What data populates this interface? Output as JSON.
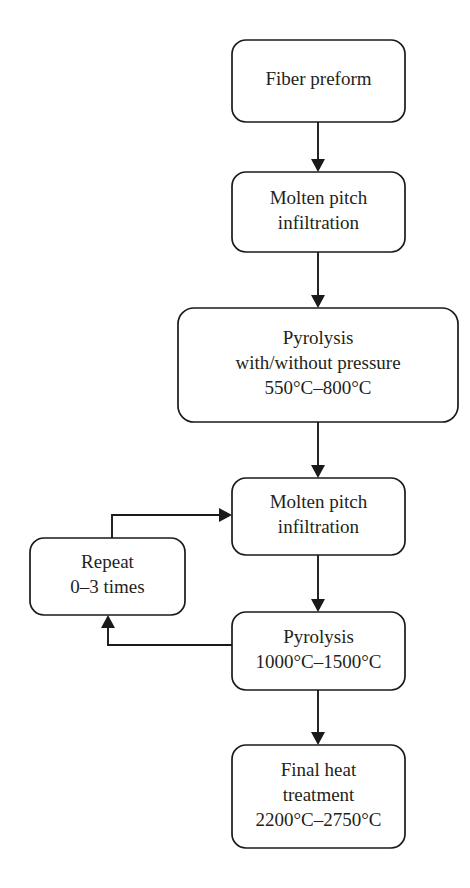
{
  "diagram": {
    "style": {
      "line_color": "#1a1a1a",
      "box_fill": "#ffffff",
      "text_color": "#231f20",
      "background": "#ffffff"
    },
    "nodes": [
      {
        "id": "fiber-preform",
        "name": "fiber-preform",
        "lines": [
          "Fiber preform"
        ],
        "x": 232,
        "y": 40,
        "w": 173,
        "h": 82,
        "r": 14
      },
      {
        "id": "molten-pitch-1",
        "name": "molten-pitch-infiltration-1",
        "lines": [
          "Molten pitch",
          "infiltration"
        ],
        "x": 232,
        "y": 172,
        "w": 173,
        "h": 80,
        "r": 14
      },
      {
        "id": "pyrolysis-1",
        "name": "pyrolysis-low-temperature",
        "lines": [
          "Pyrolysis",
          "with/without pressure",
          "550°C–800°C"
        ],
        "x": 178,
        "y": 308,
        "w": 280,
        "h": 114,
        "r": 16
      },
      {
        "id": "molten-pitch-2",
        "name": "molten-pitch-infiltration-2",
        "lines": [
          "Molten pitch",
          "infiltration"
        ],
        "x": 232,
        "y": 478,
        "w": 173,
        "h": 77,
        "r": 14
      },
      {
        "id": "repeat",
        "name": "repeat-loop",
        "lines": [
          "Repeat",
          "0–3 times"
        ],
        "x": 30,
        "y": 538,
        "w": 155,
        "h": 77,
        "r": 14
      },
      {
        "id": "pyrolysis-2",
        "name": "pyrolysis-high-temperature",
        "lines": [
          "Pyrolysis",
          "1000°C–1500°C"
        ],
        "x": 232,
        "y": 612,
        "w": 173,
        "h": 78,
        "r": 14
      },
      {
        "id": "final-heat-treatment",
        "name": "final-heat-treatment",
        "lines": [
          "Final heat",
          "treatment",
          "2200°C–2750°C"
        ],
        "x": 232,
        "y": 745,
        "w": 173,
        "h": 103,
        "r": 14
      }
    ],
    "connectors": [
      {
        "id": "conn-preform-to-pitch1",
        "name": "arrow-fiber-preform-to-molten-pitch-1",
        "from": "fiber-preform",
        "to": "molten-pitch-1",
        "points": "318,122 318,168",
        "arrow": {
          "x": 318,
          "y": 172,
          "dir": "down"
        }
      },
      {
        "id": "conn-pitch1-to-pyro1",
        "name": "arrow-molten-pitch-1-to-pyrolysis-1",
        "from": "molten-pitch-1",
        "to": "pyrolysis-1",
        "points": "318,252 318,304",
        "arrow": {
          "x": 318,
          "y": 308,
          "dir": "down"
        }
      },
      {
        "id": "conn-pyro1-to-pitch2",
        "name": "arrow-pyrolysis-1-to-molten-pitch-2",
        "from": "pyrolysis-1",
        "to": "molten-pitch-2",
        "points": "318,422 318,474",
        "arrow": {
          "x": 318,
          "y": 478,
          "dir": "down"
        }
      },
      {
        "id": "conn-pitch2-to-pyro2",
        "name": "arrow-molten-pitch-2-to-pyrolysis-2",
        "from": "molten-pitch-2",
        "to": "pyrolysis-2",
        "points": "318,555 318,608",
        "arrow": {
          "x": 318,
          "y": 612,
          "dir": "down"
        }
      },
      {
        "id": "conn-pyro2-to-final",
        "name": "arrow-pyrolysis-2-to-final-heat-treatment",
        "from": "pyrolysis-2",
        "to": "final-heat-treatment",
        "points": "318,690 318,741",
        "arrow": {
          "x": 318,
          "y": 745,
          "dir": "down"
        }
      },
      {
        "id": "conn-repeat-to-pitch2",
        "name": "arrow-repeat-to-molten-pitch-2",
        "from": "repeat",
        "to": "molten-pitch-2",
        "points": "112,538 112,515 226,515",
        "arrow": {
          "x": 232,
          "y": 515,
          "dir": "right"
        }
      },
      {
        "id": "conn-pyro2-to-repeat",
        "name": "arrow-pyrolysis-2-to-repeat",
        "from": "pyrolysis-2",
        "to": "repeat",
        "points": "232,645 108,645 108,621",
        "arrow": {
          "x": 108,
          "y": 615,
          "dir": "up"
        }
      }
    ]
  }
}
